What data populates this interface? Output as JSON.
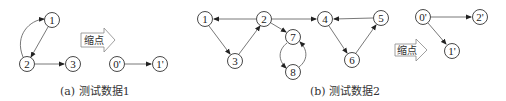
{
  "diagrams": {
    "a": {
      "caption": "(a) 测试数据1",
      "nodes": [
        {
          "id": "1",
          "label": "1",
          "x": 52,
          "y": 20
        },
        {
          "id": "2",
          "label": "2",
          "x": 27,
          "y": 64
        },
        {
          "id": "3",
          "label": "3",
          "x": 73,
          "y": 64
        }
      ],
      "edges": [
        {
          "from": "2",
          "to": "1",
          "curved": true
        },
        {
          "from": "1",
          "to": "2"
        },
        {
          "from": "2",
          "to": "3"
        }
      ],
      "contract_label": "缩点",
      "result_nodes": [
        {
          "id": "0'",
          "label": "0'",
          "x": 117,
          "y": 64
        },
        {
          "id": "1'",
          "label": "1'",
          "x": 160,
          "y": 64
        }
      ],
      "result_edges": [
        {
          "from": "0'",
          "to": "1'"
        }
      ]
    },
    "b": {
      "caption": "(b) 测试数据2",
      "nodes": [
        {
          "id": "1",
          "label": "1",
          "x": 205,
          "y": 19
        },
        {
          "id": "2",
          "label": "2",
          "x": 264,
          "y": 19
        },
        {
          "id": "3",
          "label": "3",
          "x": 235,
          "y": 61
        },
        {
          "id": "4",
          "label": "4",
          "x": 325,
          "y": 19
        },
        {
          "id": "5",
          "label": "5",
          "x": 381,
          "y": 18
        },
        {
          "id": "6",
          "label": "6",
          "x": 352,
          "y": 60
        },
        {
          "id": "7",
          "label": "7",
          "x": 293,
          "y": 37
        },
        {
          "id": "8",
          "label": "8",
          "x": 293,
          "y": 72
        }
      ],
      "edges": [
        {
          "from": "2",
          "to": "1"
        },
        {
          "from": "1",
          "to": "3"
        },
        {
          "from": "3",
          "to": "2"
        },
        {
          "from": "2",
          "to": "4"
        },
        {
          "from": "2",
          "to": "7"
        },
        {
          "from": "7",
          "to": "8",
          "curved": true
        },
        {
          "from": "8",
          "to": "7",
          "curved": true
        },
        {
          "from": "5",
          "to": "4"
        },
        {
          "from": "4",
          "to": "6"
        },
        {
          "from": "6",
          "to": "5"
        }
      ],
      "contract_label": "缩点",
      "result_nodes": [
        {
          "id": "0'",
          "label": "0'",
          "x": 423,
          "y": 17
        },
        {
          "id": "2'",
          "label": "2'",
          "x": 480,
          "y": 17
        },
        {
          "id": "1'",
          "label": "1'",
          "x": 452,
          "y": 51
        }
      ],
      "result_edges": [
        {
          "from": "0'",
          "to": "2'"
        },
        {
          "from": "0'",
          "to": "1'"
        }
      ]
    }
  }
}
